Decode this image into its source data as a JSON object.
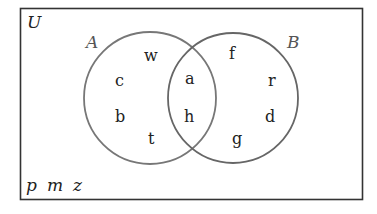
{
  "diagram": {
    "type": "venn",
    "universe_label": "U",
    "sets": [
      {
        "label": "A",
        "only": [
          "w",
          "c",
          "b",
          "t"
        ]
      },
      {
        "label": "B",
        "only": [
          "f",
          "r",
          "d",
          "g"
        ]
      }
    ],
    "intersection": [
      "a",
      "h"
    ],
    "outside": [
      "p",
      "m",
      "z"
    ],
    "colors": {
      "frame": "#333333",
      "circles": "#777777",
      "text": "#222222"
    }
  }
}
